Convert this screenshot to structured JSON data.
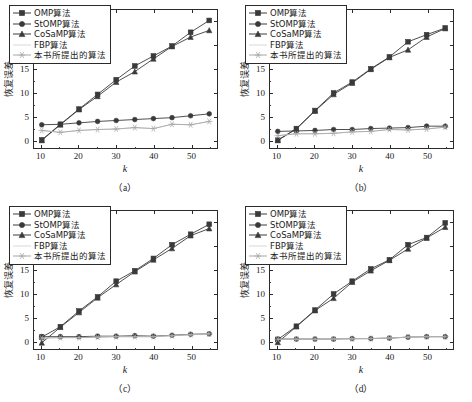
{
  "figure": {
    "panels": [
      {
        "caption": "（a）",
        "xlabel": "k",
        "ylabel": "恢复误差"
      },
      {
        "caption": "（b）",
        "xlabel": "k",
        "ylabel": "恢复误差"
      },
      {
        "caption": "（c）",
        "xlabel": "k",
        "ylabel": "恢复误差"
      },
      {
        "caption": "（d）",
        "xlabel": "k",
        "ylabel": "恢复误差"
      }
    ]
  },
  "legend": {
    "items": [
      {
        "label": "OMP算法",
        "marker": "square",
        "color": "#3a3a3a"
      },
      {
        "label": "StOMP算法",
        "marker": "circle",
        "color": "#3a3a3a"
      },
      {
        "label": "CoSaMP算法",
        "marker": "triangle",
        "color": "#3a3a3a"
      },
      {
        "label": "FBP算法",
        "marker": "none",
        "color": "#d8d8d8"
      },
      {
        "label": "本书所提出的算法",
        "marker": "star",
        "color": "#a8a8a8"
      }
    ]
  },
  "chart_data": [
    {
      "type": "line",
      "title": "（a）",
      "xlabel": "k",
      "ylabel": "恢复误差",
      "xlim": [
        8,
        57
      ],
      "ylim": [
        -1.6,
        27.5
      ],
      "xticks": [
        10,
        20,
        30,
        40,
        50
      ],
      "yticks": [
        0,
        5,
        10,
        15,
        20,
        25
      ],
      "grid": false,
      "legend_position": "upper-left",
      "x": [
        10,
        15,
        20,
        25,
        30,
        35,
        40,
        45,
        50,
        55
      ],
      "series": [
        {
          "name": "OMP算法",
          "values": [
            0.1,
            3.4,
            6.6,
            9.7,
            12.8,
            15.7,
            17.8,
            19.9,
            22.8,
            25.3
          ]
        },
        {
          "name": "StOMP算法",
          "values": [
            3.3,
            3.4,
            3.7,
            4.0,
            4.2,
            4.4,
            4.6,
            4.8,
            5.2,
            5.6
          ]
        },
        {
          "name": "CoSaMP算法",
          "values": [
            0.0,
            3.3,
            6.5,
            9.3,
            12.3,
            14.5,
            17.2,
            19.8,
            21.8,
            23.2
          ]
        },
        {
          "name": "FBP算法",
          "values": [
            2.1,
            1.7,
            2.1,
            2.3,
            2.4,
            2.7,
            2.5,
            3.4,
            3.3,
            4.0
          ]
        },
        {
          "name": "本书所提出的算法",
          "values": [
            2.1,
            1.7,
            2.1,
            2.3,
            2.4,
            2.7,
            2.5,
            3.4,
            3.3,
            4.0
          ]
        }
      ]
    },
    {
      "type": "line",
      "title": "（b）",
      "xlabel": "k",
      "ylabel": "恢复误差",
      "xlim": [
        8,
        57
      ],
      "ylim": [
        -1.6,
        27.5
      ],
      "xticks": [
        10,
        20,
        30,
        40,
        50
      ],
      "yticks": [
        0,
        5,
        10,
        15,
        20,
        25
      ],
      "grid": false,
      "legend_position": "upper-left",
      "x": [
        10,
        15,
        20,
        25,
        30,
        35,
        40,
        45,
        50,
        55
      ],
      "series": [
        {
          "name": "OMP算法",
          "values": [
            0.05,
            2.5,
            6.3,
            10.0,
            12.3,
            15.1,
            17.6,
            20.8,
            22.3,
            23.7
          ]
        },
        {
          "name": "StOMP算法",
          "values": [
            1.9,
            2.0,
            2.1,
            2.3,
            2.3,
            2.5,
            2.6,
            2.7,
            3.0,
            3.0
          ]
        },
        {
          "name": "CoSaMP算法",
          "values": [
            0.0,
            2.4,
            6.2,
            9.7,
            12.1,
            15.0,
            17.5,
            19.1,
            21.8,
            23.6
          ]
        },
        {
          "name": "FBP算法",
          "values": [
            1.0,
            1.4,
            1.4,
            1.5,
            1.8,
            1.9,
            2.3,
            2.2,
            2.4,
            2.8
          ]
        },
        {
          "name": "本书所提出的算法",
          "values": [
            1.0,
            1.4,
            1.4,
            1.5,
            1.8,
            1.9,
            2.3,
            2.2,
            2.4,
            2.8
          ]
        }
      ]
    },
    {
      "type": "line",
      "title": "（c）",
      "xlabel": "k",
      "ylabel": "恢复误差",
      "xlim": [
        8,
        57
      ],
      "ylim": [
        -1.6,
        27.5
      ],
      "xticks": [
        10,
        20,
        30,
        40,
        50
      ],
      "yticks": [
        0,
        5,
        10,
        15,
        20,
        25
      ],
      "grid": false,
      "legend_position": "upper-left",
      "x": [
        10,
        15,
        20,
        25,
        30,
        35,
        40,
        45,
        50,
        55
      ],
      "series": [
        {
          "name": "OMP算法",
          "values": [
            0.9,
            3.1,
            6.4,
            9.4,
            12.7,
            14.9,
            17.5,
            20.4,
            22.6,
            24.7
          ]
        },
        {
          "name": "StOMP算法",
          "values": [
            1.0,
            1.0,
            1.0,
            1.1,
            1.1,
            1.2,
            1.1,
            1.3,
            1.5,
            1.6
          ]
        },
        {
          "name": "CoSaMP算法",
          "values": [
            -0.3,
            3.0,
            6.1,
            9.2,
            12.0,
            14.7,
            17.2,
            19.6,
            22.3,
            23.8
          ]
        },
        {
          "name": "FBP算法",
          "values": [
            0.7,
            0.8,
            0.8,
            0.9,
            1.0,
            1.0,
            1.0,
            1.2,
            1.4,
            1.6
          ]
        },
        {
          "name": "本书所提出的算法",
          "values": [
            0.7,
            0.8,
            0.8,
            0.9,
            1.0,
            1.0,
            1.0,
            1.2,
            1.4,
            1.6
          ]
        }
      ]
    },
    {
      "type": "line",
      "title": "（d）",
      "xlabel": "k",
      "ylabel": "恢复误差",
      "xlim": [
        8,
        57
      ],
      "ylim": [
        -1.6,
        27.5
      ],
      "xticks": [
        10,
        20,
        30,
        40,
        50
      ],
      "yticks": [
        0,
        5,
        10,
        15,
        20,
        25
      ],
      "grid": false,
      "legend_position": "upper-left",
      "x": [
        10,
        15,
        20,
        25,
        30,
        35,
        40,
        45,
        50,
        55
      ],
      "series": [
        {
          "name": "OMP算法",
          "values": [
            0.4,
            3.2,
            6.6,
            10.0,
            12.7,
            15.3,
            17.2,
            20.4,
            21.9,
            25.0
          ]
        },
        {
          "name": "StOMP算法",
          "values": [
            0.5,
            0.5,
            0.5,
            0.5,
            0.6,
            0.6,
            0.7,
            0.9,
            1.0,
            1.0
          ]
        },
        {
          "name": "CoSaMP算法",
          "values": [
            -0.2,
            3.1,
            6.5,
            9.1,
            12.5,
            14.9,
            17.1,
            19.5,
            21.8,
            24.1
          ]
        },
        {
          "name": "FBP算法",
          "values": [
            0.45,
            0.45,
            0.45,
            0.5,
            0.55,
            0.6,
            0.7,
            0.9,
            1.0,
            1.0
          ]
        },
        {
          "name": "本书所提出的算法",
          "values": [
            0.45,
            0.45,
            0.45,
            0.5,
            0.55,
            0.6,
            0.7,
            0.9,
            1.0,
            1.0
          ]
        }
      ]
    }
  ]
}
